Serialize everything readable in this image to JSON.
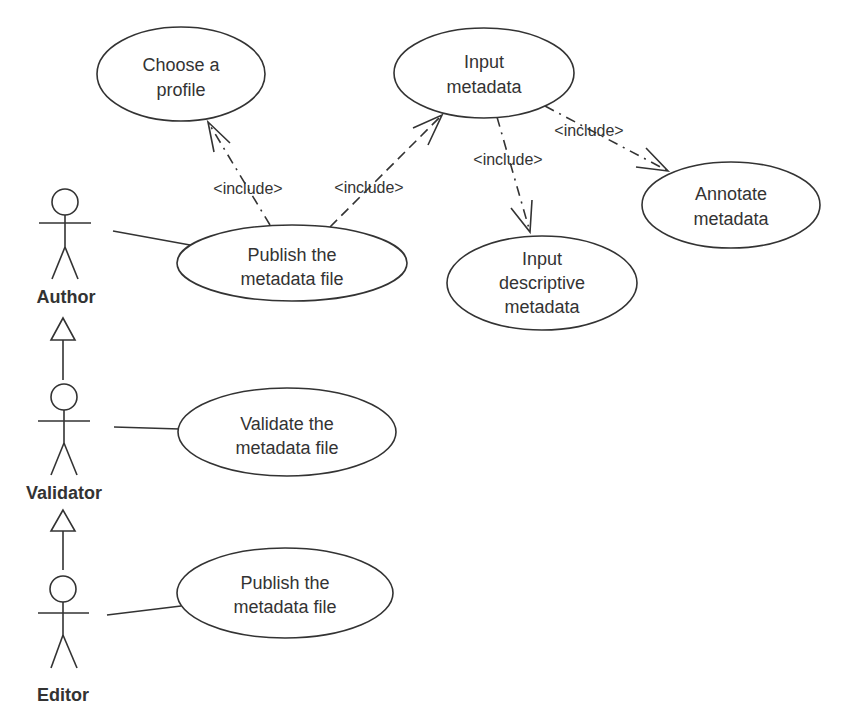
{
  "diagram": {
    "type": "uml-use-case",
    "actors": [
      {
        "id": "author",
        "label": "Author"
      },
      {
        "id": "validator",
        "label": "Validator"
      },
      {
        "id": "editor",
        "label": "Editor"
      }
    ],
    "use_cases": [
      {
        "id": "choose-profile",
        "lines": [
          "Choose a",
          "profile"
        ]
      },
      {
        "id": "input-metadata",
        "lines": [
          "Input",
          "metadata"
        ]
      },
      {
        "id": "annotate-metadata",
        "lines": [
          "Annotate",
          "metadata"
        ]
      },
      {
        "id": "publish-author",
        "lines": [
          "Publish the",
          "metadata file"
        ]
      },
      {
        "id": "input-descriptive",
        "lines": [
          "Input",
          "descriptive",
          "metadata"
        ]
      },
      {
        "id": "validate",
        "lines": [
          "Validate the",
          "metadata file"
        ]
      },
      {
        "id": "publish-editor",
        "lines": [
          "Publish the",
          "metadata file"
        ]
      }
    ],
    "relations": [
      {
        "from": "publish-author",
        "to": "choose-profile",
        "label": "<include>"
      },
      {
        "from": "publish-author",
        "to": "input-metadata",
        "label": "<include>"
      },
      {
        "from": "input-metadata",
        "to": "input-descriptive",
        "label": "<include>"
      },
      {
        "from": "input-metadata",
        "to": "annotate-metadata",
        "label": "<include>"
      }
    ],
    "generalizations": [
      {
        "child": "validator",
        "parent": "author"
      },
      {
        "child": "editor",
        "parent": "validator"
      }
    ],
    "associations": [
      {
        "actor": "author",
        "use_case": "publish-author"
      },
      {
        "actor": "validator",
        "use_case": "validate"
      },
      {
        "actor": "editor",
        "use_case": "publish-editor"
      }
    ]
  },
  "colors": {
    "stroke": "#333333",
    "text": "#333333",
    "background": "#ffffff"
  }
}
